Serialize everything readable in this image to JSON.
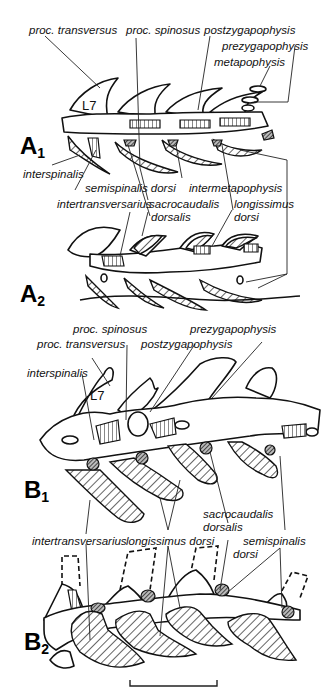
{
  "figure": {
    "panels": [
      {
        "id": "A1",
        "letter": "A",
        "sub": "1",
        "vertebra_label": "L7"
      },
      {
        "id": "A2",
        "letter": "A",
        "sub": "2"
      },
      {
        "id": "B1",
        "letter": "B",
        "sub": "1",
        "vertebra_label": "L7"
      },
      {
        "id": "B2",
        "letter": "B",
        "sub": "2"
      }
    ],
    "labels_A1": {
      "proc_transversus": "proc. transversus",
      "proc_spinosus": "proc. spinosus",
      "postzygapophysis": "postzygapophysis",
      "prezygapophysis": "prezygapophysis",
      "metapophysis": "metapophysis",
      "interspinalis": "interspinalis",
      "semispinalis_dorsi": "semispinalis dorsi",
      "intermetapophysis": "intermetapophysis",
      "intertransversarius": "intertransversarius",
      "sacrocaudalis_1": "sacrocaudalis",
      "sacrocaudalis_2": "dorsalis",
      "longissimus_1": "longissimus",
      "longissimus_2": "dorsi"
    },
    "labels_B1": {
      "proc_spinosus": "proc. spinosus",
      "prezygapophysis": "prezygapophysis",
      "proc_transversus": "proc. transversus",
      "postzygapophysis": "postzygapophysis",
      "interspinalis": "interspinalis",
      "sacrocaudalis_1": "sacrocaudalis",
      "sacrocaudalis_2": "dorsalis",
      "intertransversarius": "intertransversarius",
      "longissimus_dorsi": "longissimus dorsi",
      "semispinalis_1": "semispinalis",
      "semispinalis_2": "dorsi"
    },
    "scale_bar": {
      "label": ""
    }
  }
}
